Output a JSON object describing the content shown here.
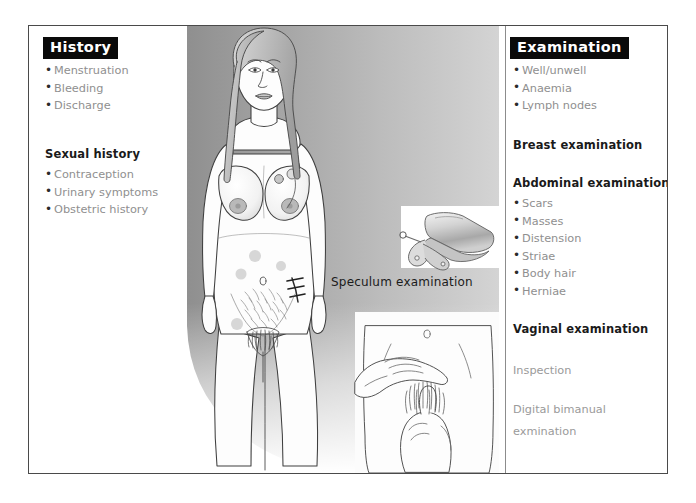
{
  "page": {
    "background_color": "#ffffff",
    "frame_border_color": "#4a4a4a"
  },
  "left_column": {
    "header": "History",
    "bullets": [
      "Menstruation",
      "Bleeding",
      "Discharge"
    ],
    "subsection": {
      "header": "Sexual history",
      "bullets": [
        "Contraception",
        "Urinary symptoms",
        "Obstetric history"
      ]
    }
  },
  "right_column": {
    "header": "Examination",
    "bullets": [
      "Well/unwell",
      "Anaemia",
      "Lymph nodes"
    ],
    "breast": {
      "header": "Breast examination"
    },
    "abdominal": {
      "header": "Abdominal examination",
      "bullets": [
        "Scars",
        "Masses",
        "Distension",
        "Striae",
        "Body hair",
        "Herniae"
      ]
    },
    "vaginal": {
      "header": "Vaginal examination",
      "lines": [
        "Inspection",
        "Digital bimanual",
        "exmination"
      ]
    }
  },
  "illustration": {
    "figure_name": "female-torso-anterior",
    "speculum_caption": "Speculum examination",
    "bimanual_name": "bimanual-examination",
    "gradient_left_color": "#9a9a9a",
    "gradient_right_color": "#cfcfcf",
    "skin_color": "#fdfdfd",
    "outline_color": "#3c3c3c"
  }
}
